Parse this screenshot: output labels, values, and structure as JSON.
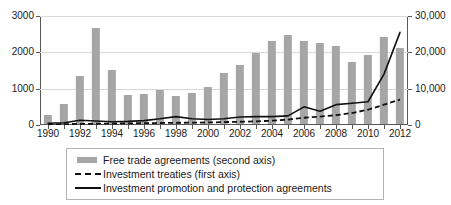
{
  "chart_data": {
    "type": "bar",
    "title": "",
    "subtitle": "",
    "xlabel": "",
    "ylabel": "",
    "grid": true,
    "legend_position": "bottom",
    "x": [
      1990,
      1991,
      1992,
      1993,
      1994,
      1995,
      1996,
      1997,
      1998,
      1999,
      2000,
      2001,
      2002,
      2003,
      2004,
      2005,
      2006,
      2007,
      2008,
      2009,
      2010,
      2011,
      2012
    ],
    "categories": [
      "1990",
      "1991",
      "1992",
      "1993",
      "1994",
      "1995",
      "1996",
      "1997",
      "1998",
      "1999",
      "2000",
      "2001",
      "2002",
      "2003",
      "2004",
      "2005",
      "2006",
      "2007",
      "2008",
      "2009",
      "2010",
      "2011",
      "2012"
    ],
    "x_tick_labels": [
      "1990",
      "1992",
      "1994",
      "1996",
      "1998",
      "2000",
      "2002",
      "2004",
      "2006",
      "2008",
      "2010",
      "2012"
    ],
    "axes": {
      "left": {
        "name": "first axis",
        "ylim": [
          0,
          3000
        ],
        "ticks": [
          0,
          1000,
          2000,
          3000
        ],
        "tick_labels": [
          "0",
          "1000",
          "2000",
          "3000"
        ]
      },
      "right": {
        "name": "second axis",
        "ylim": [
          0,
          30000
        ],
        "ticks": [
          0,
          10000,
          20000,
          30000
        ],
        "tick_labels": [
          "0",
          "10,000",
          "20,000",
          "30,000"
        ]
      }
    },
    "series": [
      {
        "name": "Free trade agreements (second axis)",
        "legend_label": "Free trade agreements (second axis)",
        "type": "bar",
        "axis": "right",
        "color": "#a6a6a6",
        "values": [
          2400,
          5500,
          13300,
          26400,
          15000,
          8000,
          8200,
          9300,
          7800,
          8600,
          10100,
          14000,
          16200,
          19500,
          22800,
          24600,
          22900,
          22400,
          21600,
          17200,
          19000,
          24000,
          20900
        ]
      },
      {
        "name": "Investment treaties (first axis)",
        "legend_label": "Investment treaties (first axis)",
        "type": "line",
        "style": "dashed",
        "axis": "left",
        "color": "#111111",
        "values": [
          20,
          25,
          30,
          35,
          40,
          45,
          50,
          55,
          60,
          65,
          70,
          80,
          90,
          100,
          120,
          150,
          200,
          230,
          270,
          330,
          420,
          560,
          700
        ]
      },
      {
        "name": "Investment promotion and protection agreements",
        "legend_label": "Investment promotion and protection agreements",
        "type": "line",
        "style": "solid",
        "axis": "left",
        "color": "#111111",
        "values": [
          50,
          60,
          130,
          110,
          90,
          100,
          120,
          170,
          230,
          170,
          150,
          170,
          220,
          230,
          230,
          250,
          500,
          380,
          560,
          600,
          640,
          1400,
          2550
        ]
      }
    ]
  }
}
